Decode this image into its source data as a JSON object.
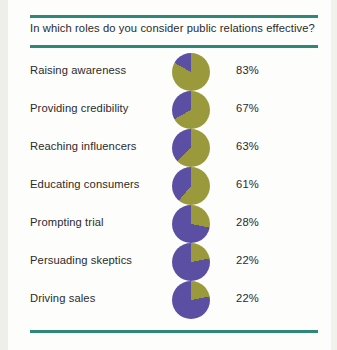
{
  "page": {
    "background_color": "#fdfdfb",
    "rule_color": "#2d8878",
    "text_color": "#2b2b2b"
  },
  "header": {
    "title": "In which roles do you consider public relations effective?"
  },
  "chart_data": {
    "type": "pie",
    "title": "In which roles do you consider public relations effective?",
    "xlabel": "",
    "ylabel": "",
    "legend_position": "none",
    "grid": false,
    "value_suffix": "%",
    "colors": {
      "effective": "#9a9a3c",
      "remainder": "#5b4fa4"
    },
    "categories": [
      "Raising awareness",
      "Providing credibility",
      "Reaching influencers",
      "Educating consumers",
      "Prompting trial",
      "Persuading skeptics",
      "Driving sales"
    ],
    "values": [
      83,
      67,
      63,
      61,
      28,
      22,
      22
    ],
    "rows": [
      {
        "label": "Raising awareness",
        "value": 83,
        "value_label": "83%"
      },
      {
        "label": "Providing credibility",
        "value": 67,
        "value_label": "67%"
      },
      {
        "label": "Reaching influencers",
        "value": 63,
        "value_label": "63%"
      },
      {
        "label": "Educating consumers",
        "value": 61,
        "value_label": "61%"
      },
      {
        "label": "Prompting trial",
        "value": 28,
        "value_label": "28%"
      },
      {
        "label": "Persuading skeptics",
        "value": 22,
        "value_label": "22%"
      },
      {
        "label": "Driving sales",
        "value": 22,
        "value_label": "22%"
      }
    ]
  }
}
